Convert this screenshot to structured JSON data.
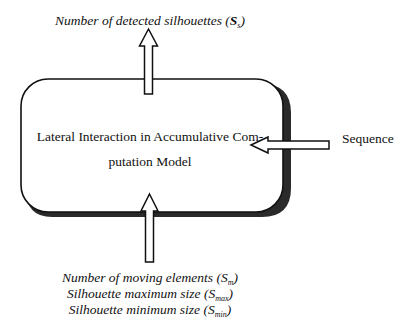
{
  "diagram": {
    "type": "block-diagram",
    "central_block": {
      "label_line1": "Lateral Interaction in Accumulative Com-",
      "label_line2": "putation Model",
      "shape": "rounded-rectangle-with-drop-shadow"
    },
    "output": {
      "direction": "up",
      "label_prefix": "Number of detected silhouettes (",
      "symbol": "S",
      "subscript": "s",
      "label_suffix": ")"
    },
    "side_input": {
      "direction": "left",
      "label": "Sequence"
    },
    "bottom_inputs": {
      "direction": "up",
      "items": [
        {
          "prefix": "Number of moving elements (",
          "symbol": "S",
          "subscript": "m",
          "suffix": ")"
        },
        {
          "prefix": "Silhouette maximum size (",
          "symbol": "S",
          "subscript": "max",
          "suffix": ")"
        },
        {
          "prefix": "Silhouette minimum size (",
          "symbol": "S",
          "subscript": "min",
          "suffix": ")"
        }
      ]
    },
    "colors": {
      "stroke": "#111111",
      "shadow": "#2a2a2a",
      "fill": "#ffffff"
    }
  }
}
